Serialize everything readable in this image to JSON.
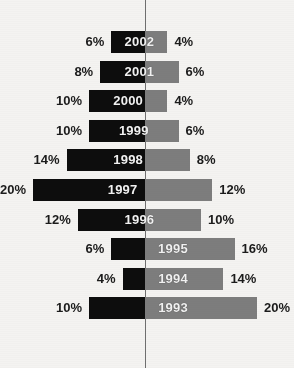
{
  "chart_data": {
    "type": "bar",
    "title": "",
    "subtitle": "",
    "xlabel": "",
    "ylabel": "",
    "orientation": "horizontal-diverging",
    "categories": [
      "2002",
      "2001",
      "2000",
      "1999",
      "1998",
      "1997",
      "1996",
      "1995",
      "1994",
      "1993"
    ],
    "series": [
      {
        "name": "left",
        "color": "#0d0d0d",
        "values": [
          6,
          8,
          10,
          10,
          14,
          20,
          12,
          6,
          4,
          10
        ],
        "labels": [
          "6%",
          "8%",
          "10%",
          "10%",
          "14%",
          "20%",
          "12%",
          "6%",
          "4%",
          "10%"
        ]
      },
      {
        "name": "right",
        "color": "#7d7d7d",
        "values": [
          4,
          6,
          4,
          6,
          8,
          12,
          10,
          16,
          14,
          20
        ],
        "labels": [
          "4%",
          "6%",
          "4%",
          "6%",
          "8%",
          "12%",
          "10%",
          "16%",
          "14%",
          "20%"
        ]
      }
    ],
    "units": "%",
    "xlim": [
      -20,
      20
    ],
    "grid": false,
    "legend": "none",
    "axis_line": "vertical-zero-line"
  },
  "colors": {
    "background": "#f4f3f1",
    "bar_left": "#0d0d0d",
    "bar_right": "#7d7d7d",
    "axis_line": "#6f6f6f",
    "year_text": "#f2f2f2",
    "value_text": "#1b1b1b"
  },
  "geometry": {
    "axis_x": 145,
    "px_per_percent": 5.6,
    "row_height": 22,
    "row_pitch": 29.6,
    "first_row_top": 31,
    "label_gap": 7
  }
}
